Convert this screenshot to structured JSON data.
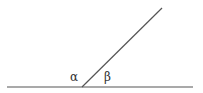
{
  "diagram": {
    "type": "angle-on-line",
    "stroke_color": "#555555",
    "baseline": {
      "x1": 7,
      "y1": 87,
      "x2": 193,
      "y2": 87
    },
    "ray": {
      "x1": 82,
      "y1": 87,
      "x2": 162,
      "y2": 8
    },
    "labels": [
      {
        "id": "alpha",
        "text": "α",
        "x": 70,
        "y": 81
      },
      {
        "id": "beta",
        "text": "β",
        "x": 104,
        "y": 81
      }
    ]
  }
}
